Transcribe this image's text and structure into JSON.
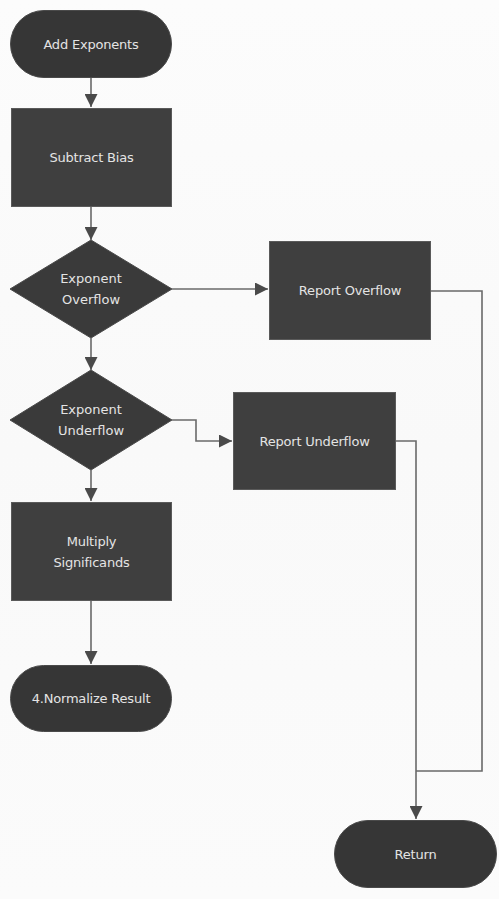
{
  "diagram": {
    "colors": {
      "node_fill": "#3f3f3f",
      "terminal_fill": "#363636",
      "text": "#e4e4e4",
      "connector": "#6a6a6a",
      "background": "#fafafa"
    },
    "nodes": {
      "add_exponents": {
        "shape": "terminal",
        "label": "Add Exponents"
      },
      "subtract_bias": {
        "shape": "process",
        "label": "Subtract Bias"
      },
      "exponent_overflow": {
        "shape": "decision",
        "label": "Exponent\nOverflow"
      },
      "report_overflow": {
        "shape": "process",
        "label": "Report Overflow"
      },
      "exponent_underflow": {
        "shape": "decision",
        "label": "Exponent\nUnderflow"
      },
      "report_underflow": {
        "shape": "process",
        "label": "Report Underflow"
      },
      "multiply_significands": {
        "shape": "process",
        "label": "Multiply\nSignificands"
      },
      "normalize_result": {
        "shape": "terminal",
        "label": "4.Normalize Result"
      },
      "return": {
        "shape": "terminal",
        "label": "Return"
      }
    },
    "edges": [
      {
        "from": "add_exponents",
        "to": "subtract_bias"
      },
      {
        "from": "subtract_bias",
        "to": "exponent_overflow"
      },
      {
        "from": "exponent_overflow",
        "to": "report_overflow"
      },
      {
        "from": "exponent_overflow",
        "to": "exponent_underflow"
      },
      {
        "from": "exponent_underflow",
        "to": "report_underflow"
      },
      {
        "from": "exponent_underflow",
        "to": "multiply_significands"
      },
      {
        "from": "multiply_significands",
        "to": "normalize_result"
      },
      {
        "from": "report_overflow",
        "to": "return"
      },
      {
        "from": "report_underflow",
        "to": "return"
      }
    ]
  }
}
